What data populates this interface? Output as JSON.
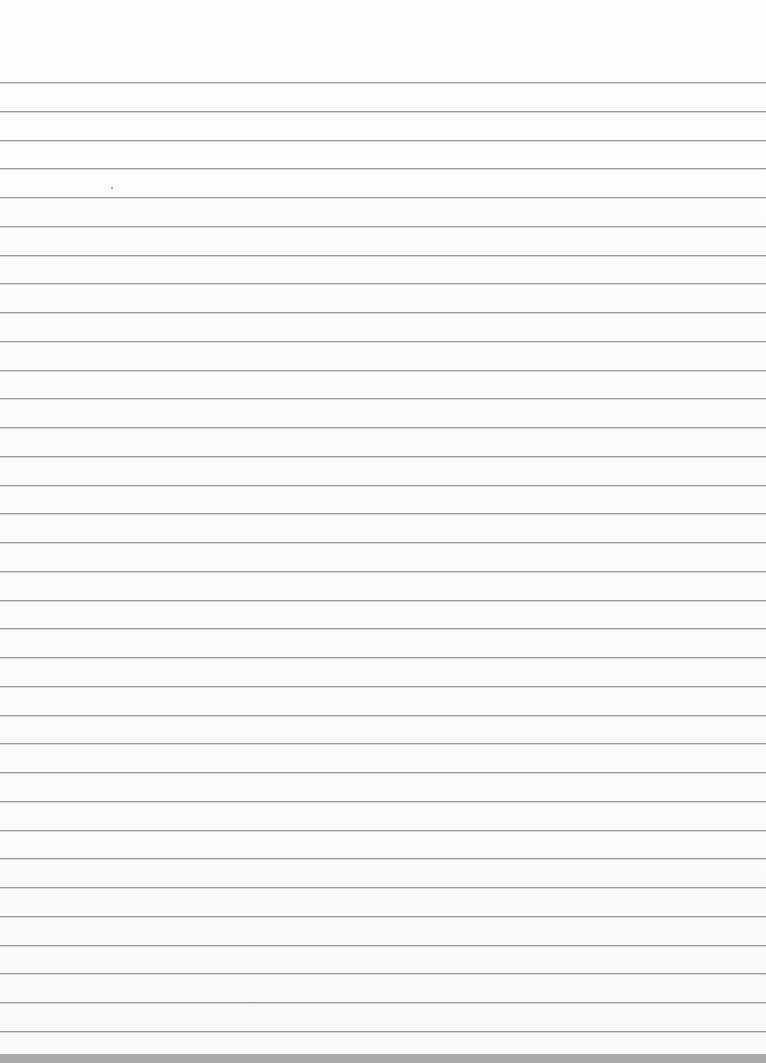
{
  "page": {
    "type": "blank ruled notebook paper",
    "background_color": "#fbfbfb",
    "rule_color": "#9a9a9a",
    "rule_count": 34,
    "first_rule_y": 82,
    "rule_spacing": 28.75,
    "bottom_edge_color": "#a9a9a9"
  },
  "speck": {
    "x": 111,
    "y": 187
  }
}
